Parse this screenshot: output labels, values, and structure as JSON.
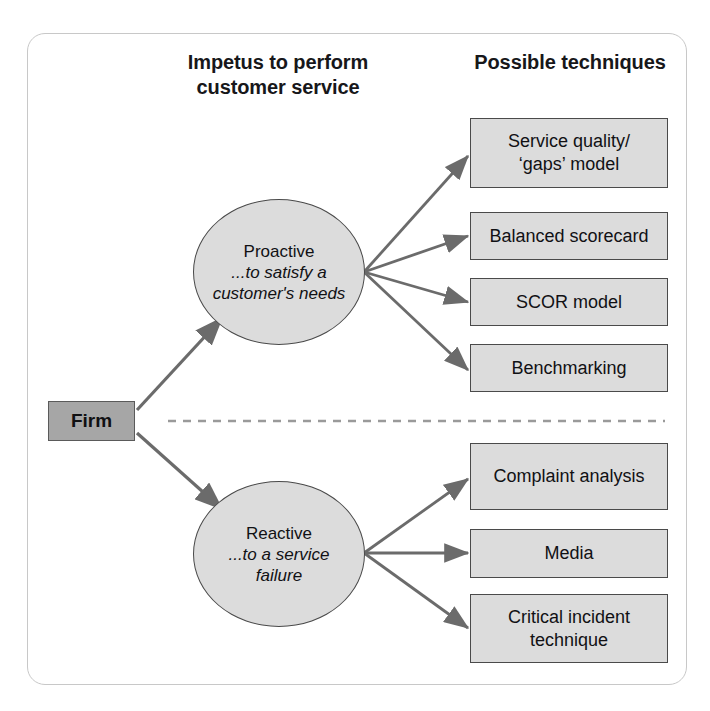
{
  "diagram": {
    "headings": {
      "left": "Impetus to perform\ncustomer service",
      "left_line1": "Impetus to perform",
      "left_line2": "customer service",
      "right": "Possible techniques"
    },
    "source_node": {
      "label": "Firm",
      "fill": "#a6a6a6",
      "stroke": "#5a5a5a"
    },
    "branches": [
      {
        "id": "proactive",
        "title": "Proactive",
        "subtitle": "...to satisfy a customer's needs",
        "fill": "#dcdcdc",
        "stroke": "#4a4a4a",
        "techniques": [
          {
            "label": "Service quality/\n'gaps' model",
            "line1": "Service quality/",
            "line2": "‘gaps’ model"
          },
          {
            "label": "Balanced scorecard",
            "line1": "Balanced scorecard",
            "line2": ""
          },
          {
            "label": "SCOR model",
            "line1": "SCOR model",
            "line2": ""
          },
          {
            "label": "Benchmarking",
            "line1": "Benchmarking",
            "line2": ""
          }
        ]
      },
      {
        "id": "reactive",
        "title": "Reactive",
        "subtitle": "...to a service failure",
        "fill": "#dcdcdc",
        "stroke": "#4a4a4a",
        "techniques": [
          {
            "label": "Complaint analysis",
            "line1": "Complaint analysis",
            "line2": ""
          },
          {
            "label": "Media",
            "line1": "Media",
            "line2": ""
          },
          {
            "label": "Critical incident\ntechnique",
            "line1": "Critical incident",
            "line2": "technique"
          }
        ]
      }
    ],
    "divider": {
      "style": "dashed",
      "color": "#9a9a9a"
    },
    "frame": {
      "color": "#c8c8c8"
    },
    "arrow_color": "#6b6b6b"
  }
}
